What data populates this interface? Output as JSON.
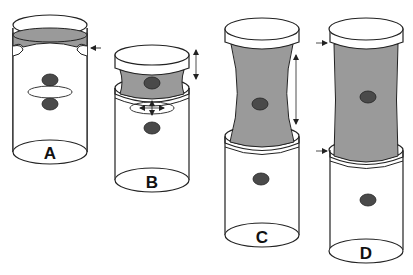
{
  "figure": {
    "colors": {
      "stroke": "#222222",
      "fill_gray": "#9a9a9a",
      "fill_white": "#ffffff",
      "dot": "#4a4a4a"
    },
    "panels": [
      {
        "id": "A",
        "label": "A",
        "annotations": [
          "left-pointing arrow at gray band"
        ]
      },
      {
        "id": "B",
        "label": "B",
        "annotations": [
          "vertical double-headed arrow beside neck",
          "four-way crosshair arrows in ring"
        ]
      },
      {
        "id": "C",
        "label": "C",
        "annotations": [
          "long vertical double-headed arrow beside neck"
        ]
      },
      {
        "id": "D",
        "label": "D",
        "annotations": [
          "right-pointing arrow at cap bottom",
          "right-pointing arrow at lower body top"
        ]
      }
    ]
  }
}
